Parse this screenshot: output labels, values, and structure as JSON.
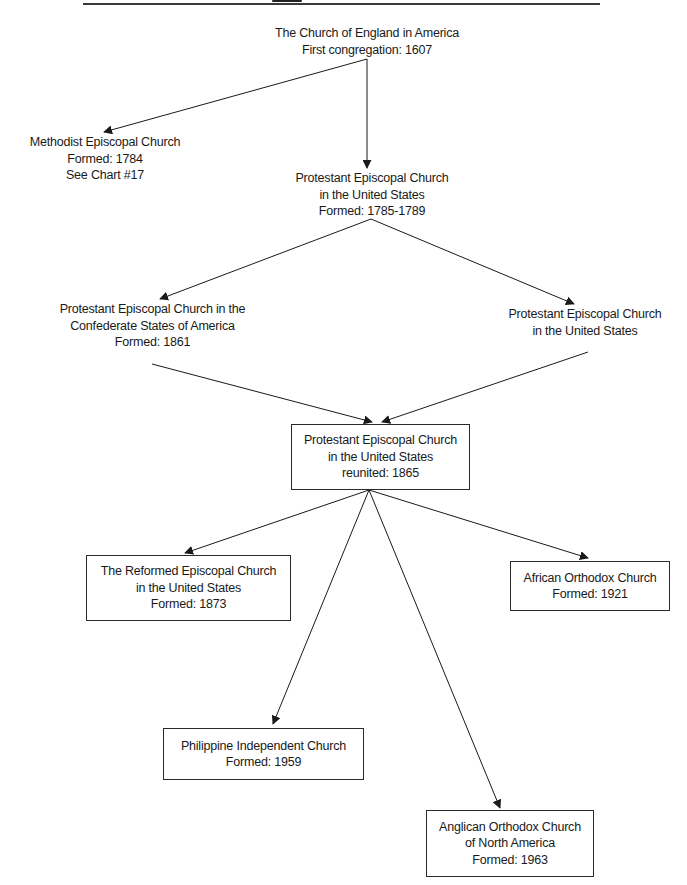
{
  "diagram": {
    "type": "church-lineage-flowchart",
    "edge_color": "#1a1a1a",
    "box_border_color": "#2a2a2a",
    "nodes": {
      "church_of_england": {
        "lines": [
          "The Church of England in America",
          "First congregation: 1607"
        ],
        "boxed": false
      },
      "methodist_episcopal": {
        "lines": [
          "Methodist Episcopal Church",
          "Formed: 1784",
          "See Chart #17"
        ],
        "boxed": false
      },
      "protestant_episcopal_us": {
        "lines": [
          "Protestant Episcopal Church",
          "in the United States",
          "Formed: 1785-1789"
        ],
        "boxed": false
      },
      "protestant_episcopal_confederate": {
        "lines": [
          "Protestant Episcopal Church in the",
          "Confederate States of America",
          "Formed: 1861"
        ],
        "boxed": false
      },
      "protestant_episcopal_us_union": {
        "lines": [
          "Protestant Episcopal Church",
          "in the United States"
        ],
        "boxed": false
      },
      "protestant_episcopal_reunited": {
        "lines": [
          "Protestant Episcopal Church",
          "in the United States",
          "reunited: 1865"
        ],
        "boxed": true
      },
      "reformed_episcopal": {
        "lines": [
          "The Reformed Episcopal Church",
          "in the United States",
          "Formed: 1873"
        ],
        "boxed": true
      },
      "african_orthodox": {
        "lines": [
          "African Orthodox Church",
          "Formed: 1921"
        ],
        "boxed": true
      },
      "philippine_independent": {
        "lines": [
          "Philippine Independent Church",
          "Formed: 1959"
        ],
        "boxed": true
      },
      "anglican_orthodox": {
        "lines": [
          "Anglican Orthodox Church",
          "of North America",
          "Formed: 1963"
        ],
        "boxed": true
      }
    },
    "edges": [
      {
        "from": "church_of_england",
        "to": "methodist_episcopal"
      },
      {
        "from": "church_of_england",
        "to": "protestant_episcopal_us"
      },
      {
        "from": "protestant_episcopal_us",
        "to": "protestant_episcopal_confederate"
      },
      {
        "from": "protestant_episcopal_us",
        "to": "protestant_episcopal_us_union"
      },
      {
        "from": "protestant_episcopal_confederate",
        "to": "protestant_episcopal_reunited"
      },
      {
        "from": "protestant_episcopal_us_union",
        "to": "protestant_episcopal_reunited"
      },
      {
        "from": "protestant_episcopal_reunited",
        "to": "reformed_episcopal"
      },
      {
        "from": "protestant_episcopal_reunited",
        "to": "african_orthodox"
      },
      {
        "from": "protestant_episcopal_reunited",
        "to": "philippine_independent"
      },
      {
        "from": "protestant_episcopal_reunited",
        "to": "anglican_orthodox"
      }
    ]
  }
}
